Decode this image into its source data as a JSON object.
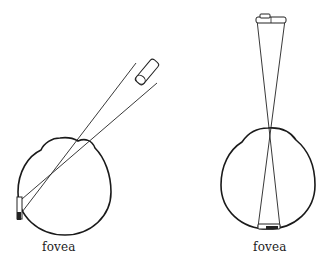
{
  "diagram": {
    "left_eye": {
      "label": "fovea",
      "description": "Eye with object off-axis; image falls on peripheral retina"
    },
    "right_eye": {
      "label": "fovea",
      "description": "Eye looking directly at object; image falls on fovea"
    },
    "colors": {
      "stroke": "#1a1a1a",
      "background": "#ffffff"
    }
  }
}
